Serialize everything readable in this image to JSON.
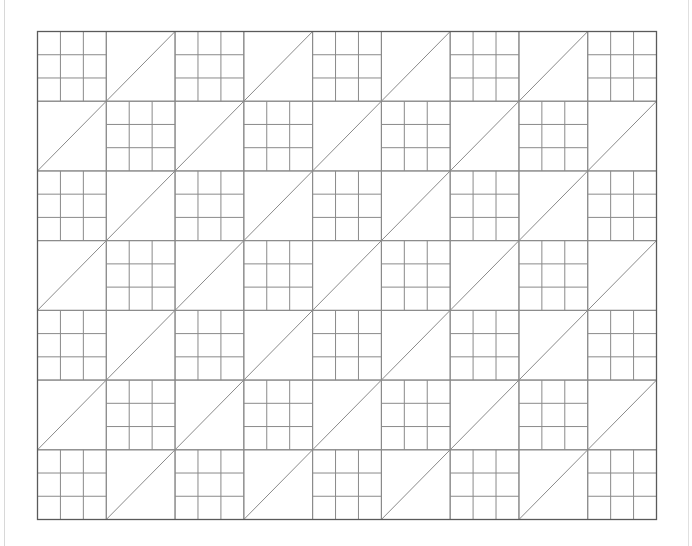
{
  "diagram": {
    "title": "",
    "type": "quilt-pattern",
    "grid": {
      "columns": 9,
      "rows": 7,
      "origin_x": 37.5,
      "origin_y": 31.5,
      "width": 619,
      "height": 488
    },
    "block_types": {
      "nine_patch": {
        "subdivisions": 3
      },
      "half_square_triangle": {
        "diagonal": "bottom-left-to-top-right"
      }
    },
    "row_patterns": [
      [
        "nine_patch",
        "half_square_triangle",
        "nine_patch",
        "half_square_triangle",
        "nine_patch",
        "half_square_triangle",
        "nine_patch",
        "half_square_triangle",
        "nine_patch"
      ],
      [
        "half_square_triangle",
        "nine_patch",
        "half_square_triangle",
        "nine_patch",
        "half_square_triangle",
        "nine_patch",
        "half_square_triangle",
        "nine_patch",
        "half_square_triangle"
      ],
      [
        "nine_patch",
        "half_square_triangle",
        "nine_patch",
        "half_square_triangle",
        "nine_patch",
        "half_square_triangle",
        "nine_patch",
        "half_square_triangle",
        "nine_patch"
      ],
      [
        "half_square_triangle",
        "nine_patch",
        "half_square_triangle",
        "nine_patch",
        "half_square_triangle",
        "nine_patch",
        "half_square_triangle",
        "nine_patch",
        "half_square_triangle"
      ],
      [
        "nine_patch",
        "half_square_triangle",
        "nine_patch",
        "half_square_triangle",
        "nine_patch",
        "half_square_triangle",
        "nine_patch",
        "half_square_triangle",
        "nine_patch"
      ],
      [
        "half_square_triangle",
        "nine_patch",
        "half_square_triangle",
        "nine_patch",
        "half_square_triangle",
        "nine_patch",
        "half_square_triangle",
        "nine_patch",
        "half_square_triangle"
      ],
      [
        "nine_patch",
        "half_square_triangle",
        "nine_patch",
        "half_square_triangle",
        "nine_patch",
        "half_square_triangle",
        "nine_patch",
        "half_square_triangle",
        "nine_patch"
      ]
    ],
    "colors": {
      "background": "#ffffff",
      "line": "#8a8a8a",
      "border": "#5a5a5a",
      "page_margin": "#d8d8d8"
    }
  }
}
